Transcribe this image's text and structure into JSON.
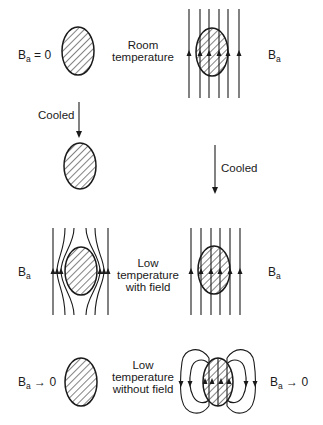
{
  "figure": {
    "colors": {
      "ink": "#1a1a1a",
      "background": "#ffffff"
    },
    "labels": {
      "field_symbol": "B",
      "field_subscript": "a",
      "eq_zero": " = 0",
      "to_zero": " → 0",
      "room_temp_line1": "Room",
      "room_temp_line2": "temperature",
      "cooled_left": "Cooled",
      "cooled_right": "Cooled",
      "low_with_line1": "Low",
      "low_with_line2": "temperature",
      "low_with_line3": "with field",
      "low_without_line1": "Low",
      "low_without_line2": "temperature",
      "low_without_line3": "without field"
    },
    "panels": [
      {
        "id": "left-room",
        "state": "B_a = 0",
        "field_lines": "none"
      },
      {
        "id": "right-room",
        "state": "B_a",
        "field_lines": "uniform, penetrating"
      },
      {
        "id": "left-cooled",
        "state": "no field",
        "field_lines": "none"
      },
      {
        "id": "left-low-with-field",
        "state": "B_a",
        "field_lines": "excluded, bent around sample"
      },
      {
        "id": "right-low-with-field",
        "state": "B_a",
        "field_lines": "uniform, penetrating"
      },
      {
        "id": "left-low-without-field",
        "state": "B_a → 0",
        "field_lines": "none"
      },
      {
        "id": "right-low-without-field",
        "state": "B_a → 0",
        "field_lines": "trapped flux, closed loops"
      }
    ]
  }
}
